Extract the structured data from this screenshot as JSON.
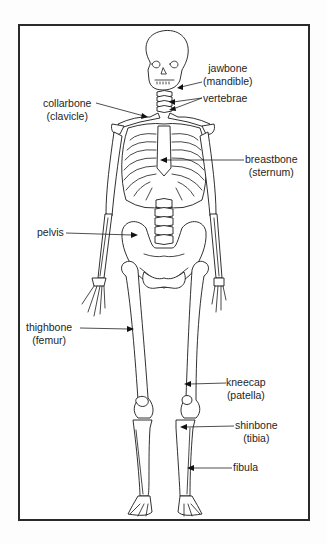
{
  "diagram": {
    "title": "",
    "colors": {
      "ink": "#1a1a1a",
      "background": "#ffffff",
      "frame": "#2a2a2a"
    },
    "labels": [
      {
        "id": "jawbone",
        "common": "jawbone",
        "scientific": "(mandible)",
        "side": "right"
      },
      {
        "id": "vertebrae",
        "common": "vertebrae",
        "scientific": "",
        "side": "right"
      },
      {
        "id": "collarbone",
        "common": "collarbone",
        "scientific": "(clavicle)",
        "side": "left"
      },
      {
        "id": "breastbone",
        "common": "breastbone",
        "scientific": "(sternum)",
        "side": "right"
      },
      {
        "id": "pelvis",
        "common": "pelvis",
        "scientific": "",
        "side": "left"
      },
      {
        "id": "thighbone",
        "common": "thighbone",
        "scientific": "(femur)",
        "side": "left"
      },
      {
        "id": "kneecap",
        "common": "kneecap",
        "scientific": "(patella)",
        "side": "right"
      },
      {
        "id": "shinbone",
        "common": "shinbone",
        "scientific": "(tibia)",
        "side": "right"
      },
      {
        "id": "fibula",
        "common": "fibula",
        "scientific": "",
        "side": "right"
      }
    ]
  }
}
